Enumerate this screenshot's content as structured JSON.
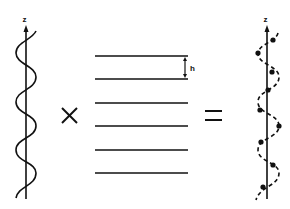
{
  "diagram": {
    "left": {
      "axis_label": "z",
      "description": "continuous helix around z axis"
    },
    "operator_times": "×",
    "middle": {
      "line_count": 6,
      "spacing_label": "h",
      "description": "set of equally spaced parallel planes"
    },
    "operator_equals": "=",
    "right": {
      "axis_label": "z",
      "description": "discrete helix: dashed helix with points at plane intersections",
      "point_count": 10
    }
  },
  "colors": {
    "ink": "#111111",
    "background": "#ffffff"
  }
}
